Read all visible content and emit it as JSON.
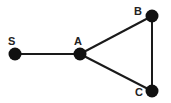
{
  "diagram": {
    "type": "graph",
    "nodes": [
      {
        "id": "S",
        "label": "S",
        "x": 15,
        "y": 54
      },
      {
        "id": "A",
        "label": "A",
        "x": 80,
        "y": 54
      },
      {
        "id": "B",
        "label": "B",
        "x": 152,
        "y": 16
      },
      {
        "id": "C",
        "label": "C",
        "x": 152,
        "y": 91
      }
    ],
    "edges": [
      {
        "from": "S",
        "to": "A"
      },
      {
        "from": "A",
        "to": "B"
      },
      {
        "from": "A",
        "to": "C"
      },
      {
        "from": "B",
        "to": "C"
      }
    ],
    "colors": {
      "node": "#111111",
      "edge": "#1a1a1a",
      "label": "#222222"
    }
  }
}
